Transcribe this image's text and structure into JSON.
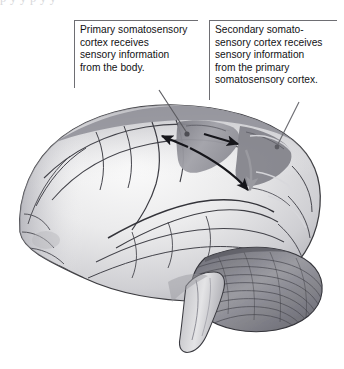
{
  "figure": {
    "width": 344,
    "height": 369,
    "background": "#ffffff",
    "cropped_text_line": "p          y        y             p      y                        y"
  },
  "callouts": [
    {
      "id": "primary",
      "name": "callout-primary-somatosensory-cortex",
      "lines": [
        "Primary somatosensory",
        "cortex receives",
        "sensory information",
        "from the body."
      ],
      "rule_color": "#6e6e73",
      "text_color": "#111114"
    },
    {
      "id": "secondary",
      "name": "callout-secondary-somatosensory-cortex",
      "lines": [
        "Secondary somato-",
        "sensory cortex receives",
        "sensory information",
        "from the primary",
        "somatosensory cortex."
      ],
      "rule_color": "#6e6e73",
      "text_color": "#111114"
    }
  ],
  "leader_lines": [
    {
      "name": "leader-line-primary",
      "from_callout": "primary",
      "target": "primary-somatosensory-gyrus",
      "color": "#5b5b60"
    },
    {
      "name": "leader-line-secondary",
      "from_callout": "secondary",
      "target": "secondary-somatosensory-region",
      "color": "#6b6b70"
    }
  ],
  "arrows": [
    {
      "name": "arrow-sensory-input-to-primary",
      "direction": "left",
      "meaning": "sensory information from the body enters primary somatosensory cortex",
      "color": "#1a1a1d"
    },
    {
      "name": "arrow-primary-to-secondary-upper",
      "direction": "up-right",
      "meaning": "primary somatosensory cortex projects to secondary somatosensory cortex",
      "color": "#1a1a1d"
    },
    {
      "name": "arrow-primary-to-secondary-lower",
      "direction": "down-right",
      "meaning": "primary somatosensory cortex projects to secondary somatosensory cortex",
      "color": "#1a1a1d"
    },
    {
      "name": "arrow-secondary-region-gray",
      "direction": "down",
      "meaning": "flow within secondary somatosensory region",
      "color": "#9a9aa0"
    }
  ],
  "brain": {
    "name": "brain-lateral-view-illustration",
    "orientation": "facing-right",
    "style": "grayscale-anatomical-drawing",
    "outline_color": "#3c3c40",
    "cortex_fill_light": "#f1f1f1",
    "cortex_fill_mid": "#d3d3d6",
    "cortex_fill_dark": "#a9a9af",
    "highlight_band_color": "#8d8d94",
    "parts": [
      {
        "name": "cerebral-cortex",
        "label_visible": false
      },
      {
        "name": "primary-somatosensory-cortex-band",
        "label_visible": false
      },
      {
        "name": "secondary-somatosensory-cortex-region",
        "label_visible": false
      },
      {
        "name": "cerebellum",
        "label_visible": false
      },
      {
        "name": "brainstem",
        "label_visible": false
      },
      {
        "name": "lateral-sulcus",
        "label_visible": false
      },
      {
        "name": "central-sulcus",
        "label_visible": false
      }
    ]
  }
}
